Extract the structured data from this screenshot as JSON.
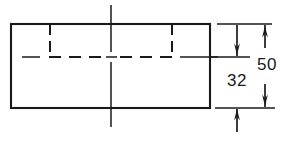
{
  "drawing": {
    "type": "engineering-orthographic-view",
    "description": "Front view of a rectangular block with hidden-line feature and two vertical dimensions",
    "stroke_color": "#1a1a1a",
    "background_color": "#ffffff",
    "outline": {
      "name": "block-outline",
      "shape": "rectangle",
      "x": 11,
      "y": 24,
      "width": 199,
      "height": 84
    },
    "hidden_feature": {
      "name": "hidden-pocket",
      "left_x": 50,
      "right_x": 172,
      "top_y": 24,
      "bottom_y": 57,
      "linetype": "hidden-dashed"
    },
    "centerlines": {
      "vertical": {
        "x": 111,
        "y1": 5,
        "y2": 127,
        "linetype": "center-dash-dot"
      },
      "horizontal": {
        "y": 57,
        "x1": 22,
        "x2": 218,
        "linetype": "center-dash-dot"
      }
    },
    "extension_lines": [
      {
        "name": "extension-line-top",
        "y": 24,
        "x1": 217,
        "x2": 272
      },
      {
        "name": "extension-line-middle",
        "y": 57,
        "x1": 210,
        "x2": 250
      },
      {
        "name": "extension-line-bottom",
        "y": 108,
        "x1": 215,
        "x2": 275
      }
    ],
    "dimensions": [
      {
        "id": "dim-50",
        "label": "50",
        "value": 50,
        "unit": "mm",
        "orientation": "vertical",
        "measures": "overall-height",
        "witness_x": 265,
        "from_y": 24,
        "to_y": 108,
        "arrow_style": "outside-pointing-in",
        "label_x": 257,
        "label_y": 56
      },
      {
        "id": "dim-32",
        "label": "32",
        "value": 32,
        "unit": "mm",
        "orientation": "vertical",
        "measures": "pocket-depth-to-base",
        "witness_x": 237,
        "from_y": 57,
        "to_y": 108,
        "arrow_style": "outside-pointing-in",
        "label_x": 227,
        "label_y": 72
      }
    ]
  },
  "labels": {
    "dim_50": "50",
    "dim_32": "32"
  }
}
